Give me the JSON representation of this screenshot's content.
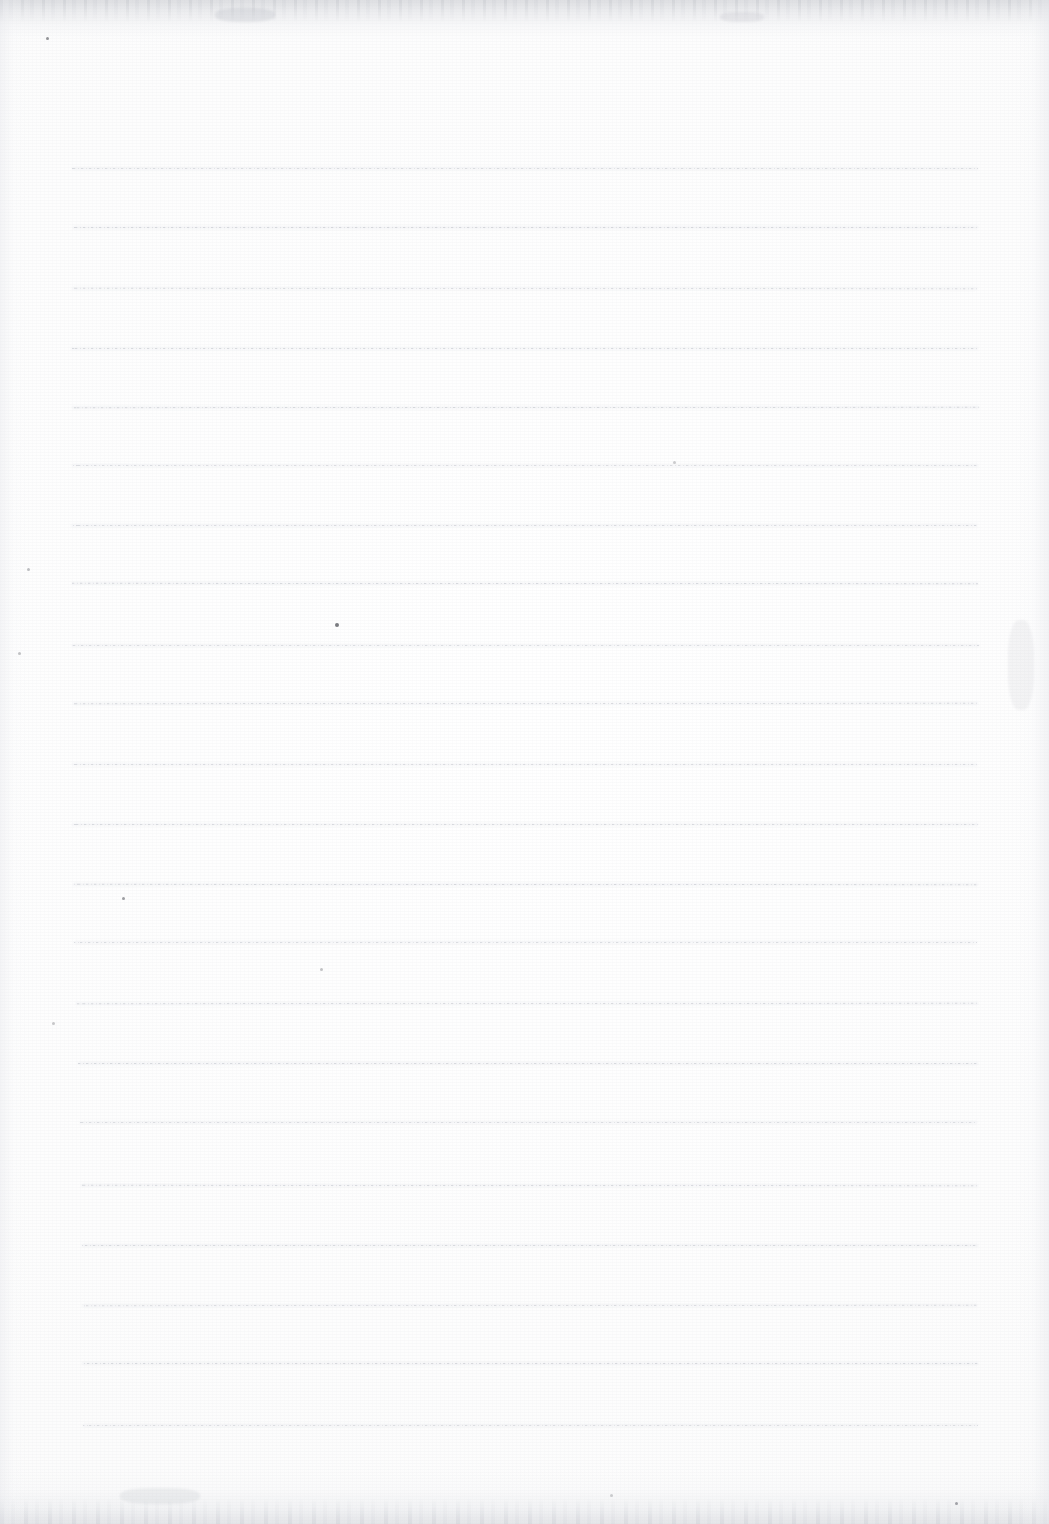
{
  "document": {
    "kind": "scanned-blank-ruled-notebook-page",
    "title": "",
    "visible_text": "",
    "page_width": 1049,
    "page_height": 1524,
    "background_color": "#fdfdfd",
    "rule_color": "#a8acb6",
    "scan_edge_color": "#c4c6cc",
    "has_handwriting": false,
    "has_printed_text": false
  },
  "ruling": {
    "line_count": 22,
    "first_line_y": 168,
    "line_spacing": 59.8,
    "line_left_x": 72,
    "line_right_x": 978,
    "line_thickness": 1,
    "style": "dotted-faint",
    "lines": [
      {
        "index": 1,
        "y": 168,
        "x1": 72,
        "x2": 978
      },
      {
        "index": 2,
        "y": 227,
        "x1": 73,
        "x2": 978
      },
      {
        "index": 3,
        "y": 288,
        "x1": 72,
        "x2": 977
      },
      {
        "index": 4,
        "y": 348,
        "x1": 71,
        "x2": 978
      },
      {
        "index": 5,
        "y": 407,
        "x1": 72,
        "x2": 979
      },
      {
        "index": 6,
        "y": 465,
        "x1": 72,
        "x2": 978
      },
      {
        "index": 7,
        "y": 525,
        "x1": 71,
        "x2": 977
      },
      {
        "index": 8,
        "y": 583,
        "x1": 72,
        "x2": 978
      },
      {
        "index": 9,
        "y": 645,
        "x1": 72,
        "x2": 979
      },
      {
        "index": 10,
        "y": 703,
        "x1": 73,
        "x2": 978
      },
      {
        "index": 11,
        "y": 764,
        "x1": 72,
        "x2": 977
      },
      {
        "index": 12,
        "y": 824,
        "x1": 72,
        "x2": 978
      },
      {
        "index": 13,
        "y": 884,
        "x1": 73,
        "x2": 978
      },
      {
        "index": 14,
        "y": 942,
        "x1": 74,
        "x2": 977
      },
      {
        "index": 15,
        "y": 1003,
        "x1": 76,
        "x2": 978
      },
      {
        "index": 16,
        "y": 1063,
        "x1": 78,
        "x2": 978
      },
      {
        "index": 17,
        "y": 1122,
        "x1": 80,
        "x2": 977
      },
      {
        "index": 18,
        "y": 1185,
        "x1": 81,
        "x2": 978
      },
      {
        "index": 19,
        "y": 1245,
        "x1": 82,
        "x2": 978
      },
      {
        "index": 20,
        "y": 1305,
        "x1": 82,
        "x2": 977
      },
      {
        "index": 21,
        "y": 1363,
        "x1": 82,
        "x2": 978
      },
      {
        "index": 22,
        "y": 1425,
        "x1": 83,
        "x2": 978
      }
    ]
  },
  "artifacts": {
    "specks": [
      {
        "name": "speck-top-left",
        "x": 46,
        "y": 37,
        "size": 3,
        "opacity": 0.55
      },
      {
        "name": "speck-left-margin-a",
        "x": 27,
        "y": 568,
        "size": 3,
        "opacity": 0.32
      },
      {
        "name": "speck-left-margin-b",
        "x": 18,
        "y": 652,
        "size": 3,
        "opacity": 0.3
      },
      {
        "name": "speck-left-margin-c",
        "x": 52,
        "y": 1022,
        "size": 3,
        "opacity": 0.28
      },
      {
        "name": "speck-mid-upper",
        "x": 335,
        "y": 623,
        "size": 4,
        "opacity": 0.68
      },
      {
        "name": "speck-left-lower",
        "x": 122,
        "y": 897,
        "size": 3,
        "opacity": 0.5
      },
      {
        "name": "speck-mid-lower",
        "x": 320,
        "y": 968,
        "size": 3,
        "opacity": 0.3
      },
      {
        "name": "speck-bottom-right",
        "x": 955,
        "y": 1502,
        "size": 3,
        "opacity": 0.45
      },
      {
        "name": "speck-above-rule-six",
        "x": 673,
        "y": 461,
        "size": 3,
        "opacity": 0.26
      },
      {
        "name": "speck-bottom-center",
        "x": 610,
        "y": 1494,
        "size": 3,
        "opacity": 0.24
      }
    ],
    "smudges": [
      {
        "name": "smudge-top-fold",
        "x": 215,
        "y": 8,
        "w": 60,
        "h": 14,
        "opacity": 0.22
      },
      {
        "name": "smudge-top-right",
        "x": 720,
        "y": 12,
        "w": 44,
        "h": 10,
        "opacity": 0.18
      },
      {
        "name": "smudge-right-edge",
        "x": 1008,
        "y": 620,
        "w": 26,
        "h": 90,
        "opacity": 0.12
      },
      {
        "name": "smudge-bottom-left",
        "x": 120,
        "y": 1488,
        "w": 80,
        "h": 16,
        "opacity": 0.16
      }
    ]
  }
}
